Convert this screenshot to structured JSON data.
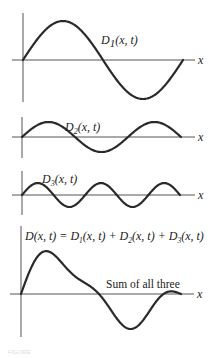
{
  "figure": {
    "panels": [
      {
        "id": "d1",
        "label_main": "D",
        "label_sub": "1",
        "label_rest": "(x, t)",
        "axis_label": "x",
        "periods": 1,
        "amplitude_px": 39
      },
      {
        "id": "d2",
        "label_main": "D",
        "label_sub": "2",
        "label_rest": "(x, t)",
        "axis_label": "x",
        "periods": 1.5,
        "amplitude_px": 15
      },
      {
        "id": "d3",
        "label_main": "D",
        "label_sub": "3",
        "label_rest": "(x, t)",
        "axis_label": "x",
        "periods": 2.5,
        "amplitude_px": 12
      },
      {
        "id": "sum",
        "equation": {
          "lhs": "D(x, t) = ",
          "t1": "D",
          "s1": "1",
          "r1": "(x, t) + ",
          "t2": "D",
          "s2": "2",
          "r2": "(x, t) + ",
          "t3": "D",
          "s3": "3",
          "r3": "(x, t)"
        },
        "annotation": "Sum of all three",
        "axis_label": "x"
      }
    ],
    "caption": "FIGURE"
  }
}
